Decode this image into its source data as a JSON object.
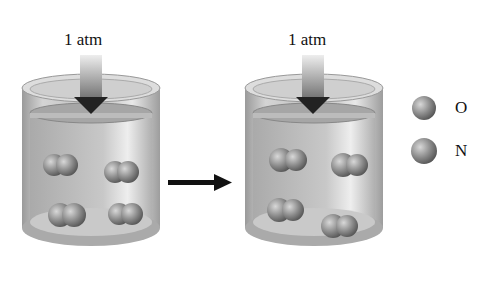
{
  "left_container": {
    "pressure_label": "1 atm",
    "molecules": 4
  },
  "right_container": {
    "pressure_label": "1 atm",
    "molecules": 5
  },
  "legend": {
    "items": [
      {
        "label": "O"
      },
      {
        "label": "N"
      }
    ]
  },
  "process_arrow": "right-arrow"
}
